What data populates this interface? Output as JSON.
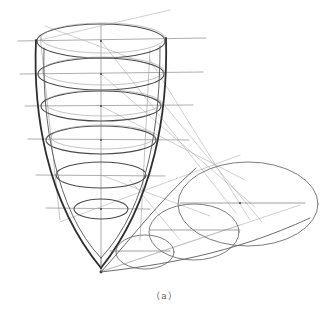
{
  "figure": {
    "caption": "（a）",
    "colors": {
      "background": "#ffffff",
      "dark_stroke": "#3a3a3a",
      "mid_stroke": "#6a6a6a",
      "light_stroke": "#a8a8a8"
    }
  }
}
